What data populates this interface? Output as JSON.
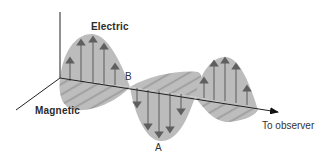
{
  "diagram": {
    "type": "electromagnetic-wave",
    "labels": {
      "electric": "Electric",
      "magnetic": "Magnetic",
      "point_b": "B",
      "point_a": "A",
      "direction": "To observer"
    },
    "colors": {
      "fill": "#b9b9b9",
      "hatch": "#8f8f8f",
      "arrow": "#6b6b6b",
      "axis": "#222222",
      "text": "#2a2a2a"
    }
  }
}
